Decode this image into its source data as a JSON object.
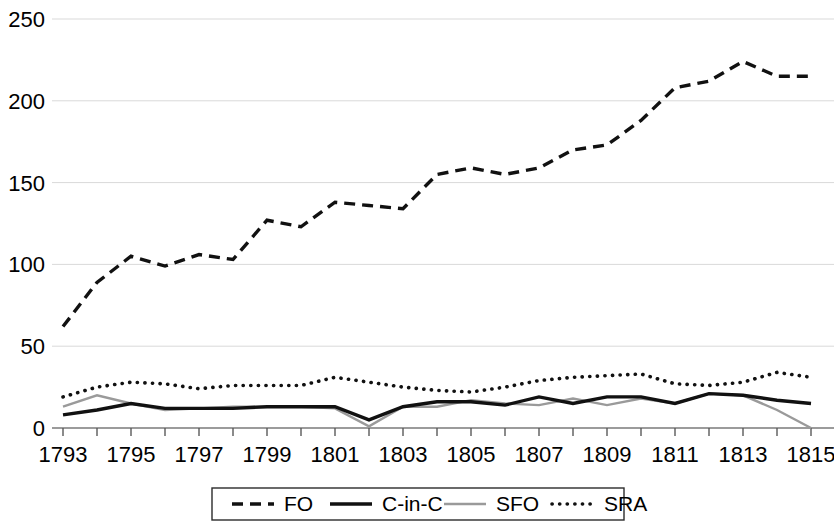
{
  "chart_data": {
    "type": "line",
    "title": "",
    "subtitle": "",
    "xlabel": "",
    "ylabel": "",
    "xlim": [
      1793,
      1815
    ],
    "ylim": [
      0,
      250
    ],
    "grid": "horizontal",
    "legend_position": "bottom",
    "x": [
      1793,
      1794,
      1795,
      1796,
      1797,
      1798,
      1799,
      1800,
      1801,
      1802,
      1803,
      1804,
      1805,
      1806,
      1807,
      1808,
      1809,
      1810,
      1811,
      1812,
      1813,
      1814,
      1815
    ],
    "xtick_labels": [
      "1793",
      "1795",
      "1797",
      "1799",
      "1801",
      "1803",
      "1805",
      "1807",
      "1809",
      "1811",
      "1813",
      "1815"
    ],
    "ytick_labels": [
      "0",
      "50",
      "100",
      "150",
      "200",
      "250"
    ],
    "yticks": [
      0,
      50,
      100,
      150,
      200,
      250
    ],
    "series": [
      {
        "name": "FO",
        "style": "dashed",
        "color": "#111111",
        "values": [
          62,
          89,
          105,
          99,
          106,
          103,
          127,
          123,
          138,
          136,
          134,
          155,
          159,
          155,
          159,
          170,
          173,
          188,
          208,
          212,
          224,
          215,
          215
        ]
      },
      {
        "name": "C-in-C",
        "style": "solid",
        "color": "#111111",
        "values": [
          8,
          11,
          15,
          12,
          12,
          12,
          13,
          13,
          13,
          5,
          13,
          16,
          16,
          14,
          19,
          15,
          19,
          19,
          15,
          21,
          20,
          17,
          15
        ]
      },
      {
        "name": "SFO",
        "style": "solid-gray",
        "color": "#9a9a9a",
        "values": [
          13,
          20,
          15,
          11,
          12,
          13,
          13,
          13,
          12,
          1,
          13,
          13,
          17,
          15,
          14,
          18,
          14,
          18,
          15,
          21,
          20,
          11,
          0
        ]
      },
      {
        "name": "SRA",
        "style": "dotted",
        "color": "#111111",
        "values": [
          19,
          25,
          28,
          27,
          24,
          26,
          26,
          26,
          31,
          28,
          25,
          23,
          22,
          25,
          29,
          31,
          32,
          33,
          27,
          26,
          28,
          34,
          31
        ]
      }
    ]
  },
  "legend": {
    "items": [
      {
        "label": "FO",
        "style": "dashed"
      },
      {
        "label": "C-in-C",
        "style": "solid"
      },
      {
        "label": "SFO",
        "style": "solid-gray"
      },
      {
        "label": "SRA",
        "style": "dotted"
      }
    ]
  }
}
